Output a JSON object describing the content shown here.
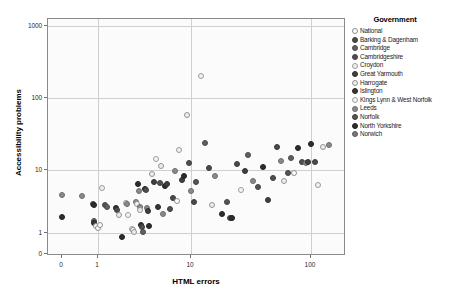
{
  "figure": {
    "background": "#ffffff",
    "panel_background": "#fbfbfb",
    "panel_border": "#8a8a8a",
    "grid_color": "#cfcfcf"
  },
  "chart_data": {
    "type": "scatter",
    "title": "",
    "xlabel": "HTML errors",
    "ylabel": "Accessibility problems",
    "xscale": "log",
    "yscale": "log",
    "grid": true,
    "legend_position": "right",
    "legend_title": "Government",
    "xticks": [
      {
        "label": "0",
        "value": 0
      },
      {
        "label": "1",
        "value": 1
      },
      {
        "label": "10",
        "value": 10
      },
      {
        "label": "100",
        "value": 100
      }
    ],
    "yticks": [
      {
        "label": "0",
        "value": 0
      },
      {
        "label": "1",
        "value": 1
      },
      {
        "label": "10",
        "value": 10
      },
      {
        "label": "100",
        "value": 100
      },
      {
        "label": "1000",
        "value": 1000
      }
    ],
    "xlim": [
      0,
      200
    ],
    "ylim": [
      0,
      1000
    ],
    "series": [
      {
        "name": "National",
        "marker": "open",
        "color": "#ffffff",
        "edge": "#8c8c8c"
      },
      {
        "name": "Barking & Dagenham",
        "marker": "filled",
        "color": "#4a4a4a",
        "edge": "#3a3a3a"
      },
      {
        "name": "Cambridge",
        "marker": "filled",
        "color": "#606060",
        "edge": "#4a4a4a"
      },
      {
        "name": "Cambridgeshire",
        "marker": "filled",
        "color": "#4f4f4f",
        "edge": "#3d3d3d"
      },
      {
        "name": "Croydon",
        "marker": "open",
        "color": "#f2f2f2",
        "edge": "#9a9a9a"
      },
      {
        "name": "Great Yarmouth",
        "marker": "filled",
        "color": "#3f3f3f",
        "edge": "#303030"
      },
      {
        "name": "Harrogate",
        "marker": "open",
        "color": "#ededed",
        "edge": "#949494"
      },
      {
        "name": "Islington",
        "marker": "filled",
        "color": "#363636",
        "edge": "#282828"
      },
      {
        "name": "Kings Lynn & West Norfolk",
        "marker": "open",
        "color": "#f4f4f4",
        "edge": "#9e9e9e"
      },
      {
        "name": "Leeds",
        "marker": "filled",
        "color": "#8a8a8a",
        "edge": "#6d6d6d"
      },
      {
        "name": "Norfolk",
        "marker": "filled",
        "color": "#555555",
        "edge": "#414141"
      },
      {
        "name": "North Yorkshire",
        "marker": "filled",
        "color": "#2e2e2e",
        "edge": "#1f1f1f"
      },
      {
        "name": "Norwich",
        "marker": "filled",
        "color": "#777777",
        "edge": "#5c5c5c"
      }
    ],
    "points": [
      {
        "x": 0.0,
        "y": 4.0,
        "s": 9
      },
      {
        "x": 0.0,
        "y": 1.8,
        "s": 11
      },
      {
        "x": 0.55,
        "y": 3.9,
        "s": 9
      },
      {
        "x": 0.85,
        "y": 2.9,
        "s": 3
      },
      {
        "x": 0.88,
        "y": 2.8,
        "s": 11
      },
      {
        "x": 0.9,
        "y": 1.55,
        "s": 2
      },
      {
        "x": 0.9,
        "y": 1.45,
        "s": 7
      },
      {
        "x": 0.95,
        "y": 1.3,
        "s": 0
      },
      {
        "x": 1.0,
        "y": 1.2,
        "s": 0
      },
      {
        "x": 1.05,
        "y": 1.35,
        "s": 0
      },
      {
        "x": 1.1,
        "y": 5.2,
        "s": 4
      },
      {
        "x": 1.2,
        "y": 2.8,
        "s": 10
      },
      {
        "x": 1.25,
        "y": 2.6,
        "s": 2
      },
      {
        "x": 1.55,
        "y": 2.45,
        "s": 11
      },
      {
        "x": 1.6,
        "y": 2.3,
        "s": 3
      },
      {
        "x": 1.7,
        "y": 1.9,
        "s": 6
      },
      {
        "x": 1.8,
        "y": 0.8,
        "s": 11
      },
      {
        "x": 2.0,
        "y": 3.0,
        "s": 6
      },
      {
        "x": 2.05,
        "y": 2.9,
        "s": 9
      },
      {
        "x": 2.1,
        "y": 1.95,
        "s": 8
      },
      {
        "x": 2.3,
        "y": 1.15,
        "s": 4
      },
      {
        "x": 2.4,
        "y": 1.1,
        "s": 0
      },
      {
        "x": 2.45,
        "y": 1.05,
        "s": 6
      },
      {
        "x": 2.55,
        "y": 3.1,
        "s": 9
      },
      {
        "x": 2.6,
        "y": 2.9,
        "s": 4
      },
      {
        "x": 2.7,
        "y": 6.0,
        "s": 11
      },
      {
        "x": 2.75,
        "y": 4.6,
        "s": 9
      },
      {
        "x": 2.8,
        "y": 2.6,
        "s": 9
      },
      {
        "x": 2.85,
        "y": 2.3,
        "s": 6
      },
      {
        "x": 2.9,
        "y": 1.35,
        "s": 11
      },
      {
        "x": 3.0,
        "y": 1.25,
        "s": 3
      },
      {
        "x": 3.05,
        "y": 1.05,
        "s": 2
      },
      {
        "x": 3.2,
        "y": 5.0,
        "s": 11
      },
      {
        "x": 3.3,
        "y": 4.8,
        "s": 3
      },
      {
        "x": 3.4,
        "y": 2.5,
        "s": 9
      },
      {
        "x": 3.45,
        "y": 2.2,
        "s": 5
      },
      {
        "x": 3.5,
        "y": 1.3,
        "s": 11
      },
      {
        "x": 3.8,
        "y": 8.5,
        "s": 6
      },
      {
        "x": 4.0,
        "y": 6.4,
        "s": 5
      },
      {
        "x": 4.2,
        "y": 14.0,
        "s": 8
      },
      {
        "x": 4.4,
        "y": 2.6,
        "s": 7
      },
      {
        "x": 4.6,
        "y": 6.2,
        "s": 3
      },
      {
        "x": 4.8,
        "y": 11.5,
        "s": 6
      },
      {
        "x": 5.0,
        "y": 2.0,
        "s": 9
      },
      {
        "x": 5.2,
        "y": 5.6,
        "s": 11
      },
      {
        "x": 5.5,
        "y": 6.0,
        "s": 5
      },
      {
        "x": 6.0,
        "y": 2.4,
        "s": 3
      },
      {
        "x": 6.4,
        "y": 3.6,
        "s": 1
      },
      {
        "x": 6.8,
        "y": 9.5,
        "s": 9
      },
      {
        "x": 7.0,
        "y": 3.2,
        "s": 0
      },
      {
        "x": 7.5,
        "y": 19.0,
        "s": 4
      },
      {
        "x": 8.0,
        "y": 7.0,
        "s": 5
      },
      {
        "x": 8.5,
        "y": 8.0,
        "s": 11
      },
      {
        "x": 9.0,
        "y": 58.0,
        "s": 6
      },
      {
        "x": 9.5,
        "y": 12.5,
        "s": 3
      },
      {
        "x": 10.0,
        "y": 4.6,
        "s": 9
      },
      {
        "x": 10.5,
        "y": 3.1,
        "s": 1
      },
      {
        "x": 11.0,
        "y": 6.5,
        "s": 10
      },
      {
        "x": 12.0,
        "y": 200.0,
        "s": 4
      },
      {
        "x": 13.0,
        "y": 24.0,
        "s": 2
      },
      {
        "x": 14.0,
        "y": 10.5,
        "s": 1
      },
      {
        "x": 15.0,
        "y": 2.8,
        "s": 6
      },
      {
        "x": 16.0,
        "y": 8.0,
        "s": 9
      },
      {
        "x": 18.0,
        "y": 2.0,
        "s": 11
      },
      {
        "x": 20.0,
        "y": 3.1,
        "s": 10
      },
      {
        "x": 21.0,
        "y": 1.75,
        "s": 3
      },
      {
        "x": 22.0,
        "y": 1.7,
        "s": 11
      },
      {
        "x": 24.0,
        "y": 12.0,
        "s": 1
      },
      {
        "x": 26.0,
        "y": 4.8,
        "s": 8
      },
      {
        "x": 28.0,
        "y": 9.5,
        "s": 5
      },
      {
        "x": 30.0,
        "y": 16.0,
        "s": 2
      },
      {
        "x": 33.0,
        "y": 6.8,
        "s": 9
      },
      {
        "x": 36.0,
        "y": 5.4,
        "s": 10
      },
      {
        "x": 40.0,
        "y": 11.0,
        "s": 11
      },
      {
        "x": 44.0,
        "y": 3.4,
        "s": 5
      },
      {
        "x": 48.0,
        "y": 7.6,
        "s": 3
      },
      {
        "x": 52.0,
        "y": 21.0,
        "s": 1
      },
      {
        "x": 56.0,
        "y": 13.5,
        "s": 9
      },
      {
        "x": 60.0,
        "y": 6.6,
        "s": 6
      },
      {
        "x": 64.0,
        "y": 9.0,
        "s": 10
      },
      {
        "x": 68.0,
        "y": 14.5,
        "s": 2
      },
      {
        "x": 72.0,
        "y": 8.8,
        "s": 0
      },
      {
        "x": 78.0,
        "y": 20.0,
        "s": 11
      },
      {
        "x": 84.0,
        "y": 13.0,
        "s": 3
      },
      {
        "x": 90.0,
        "y": 12.5,
        "s": 9
      },
      {
        "x": 95.0,
        "y": 12.8,
        "s": 5
      },
      {
        "x": 100.0,
        "y": 23.0,
        "s": 11
      },
      {
        "x": 108.0,
        "y": 13.0,
        "s": 1
      },
      {
        "x": 115.0,
        "y": 5.8,
        "s": 4
      },
      {
        "x": 125.0,
        "y": 21.0,
        "s": 6
      },
      {
        "x": 140.0,
        "y": 22.0,
        "s": 9
      }
    ]
  }
}
